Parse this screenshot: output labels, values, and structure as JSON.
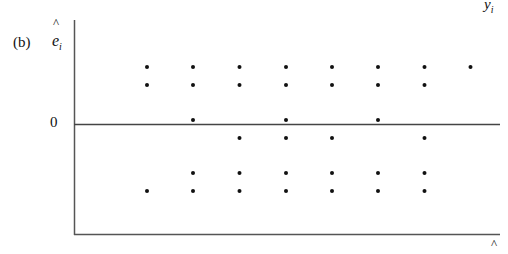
{
  "panel_label": "(b)",
  "chart_data": {
    "type": "scatter",
    "title": "",
    "panel": "(b)",
    "xlabel": "ŷ_i",
    "ylabel": "ê_i",
    "y_reference_label": "0",
    "grid": false,
    "legend": null,
    "columns_x": [
      1,
      2,
      3,
      4,
      5,
      6,
      7,
      8
    ],
    "rows_y": [
      2,
      1.5,
      0.1,
      -0.4,
      -1.4,
      -1.9
    ],
    "points": [
      {
        "x": 1,
        "y": 2
      },
      {
        "x": 1,
        "y": 1.5
      },
      {
        "x": 1,
        "y": -1.9
      },
      {
        "x": 2,
        "y": 2
      },
      {
        "x": 2,
        "y": 1.5
      },
      {
        "x": 2,
        "y": 0.1
      },
      {
        "x": 2,
        "y": -1.4
      },
      {
        "x": 2,
        "y": -1.9
      },
      {
        "x": 3,
        "y": 2
      },
      {
        "x": 3,
        "y": 1.5
      },
      {
        "x": 3,
        "y": -0.4
      },
      {
        "x": 3,
        "y": -1.4
      },
      {
        "x": 3,
        "y": -1.9
      },
      {
        "x": 4,
        "y": 2
      },
      {
        "x": 4,
        "y": 1.5
      },
      {
        "x": 4,
        "y": 0.1
      },
      {
        "x": 4,
        "y": -0.4
      },
      {
        "x": 4,
        "y": -1.4
      },
      {
        "x": 4,
        "y": -1.9
      },
      {
        "x": 5,
        "y": 2
      },
      {
        "x": 5,
        "y": 1.5
      },
      {
        "x": 5,
        "y": -0.4
      },
      {
        "x": 5,
        "y": -1.4
      },
      {
        "x": 5,
        "y": -1.9
      },
      {
        "x": 6,
        "y": 2
      },
      {
        "x": 6,
        "y": 1.5
      },
      {
        "x": 6,
        "y": 0.1
      },
      {
        "x": 6,
        "y": -1.4
      },
      {
        "x": 6,
        "y": -1.9
      },
      {
        "x": 7,
        "y": 2
      },
      {
        "x": 7,
        "y": 1.5
      },
      {
        "x": 7,
        "y": -0.4
      },
      {
        "x": 7,
        "y": -1.4
      },
      {
        "x": 7,
        "y": -1.9
      },
      {
        "x": 8,
        "y": 2
      }
    ]
  },
  "labels": {
    "ylabel_hat": "^",
    "ylabel_text": "e",
    "ylabel_sub": "i",
    "zero": "0",
    "top_right": "y",
    "top_right_sub": "i",
    "bottom_hat": "^"
  },
  "colors": {
    "axis": "#555555",
    "point": "#111111",
    "background": "#ffffff"
  }
}
